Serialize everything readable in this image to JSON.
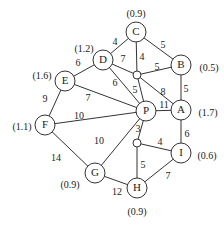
{
  "diagram": {
    "type": "weighted-graph",
    "nodes": [
      {
        "id": "C",
        "label": "C",
        "value": "(0.9)"
      },
      {
        "id": "B",
        "label": "B",
        "value": "(0.5)"
      },
      {
        "id": "D",
        "label": "D",
        "value": "(1.2)"
      },
      {
        "id": "E",
        "label": "E",
        "value": "(1.6)"
      },
      {
        "id": "P",
        "label": "P",
        "value": ""
      },
      {
        "id": "A",
        "label": "A",
        "value": "(1.7)"
      },
      {
        "id": "F",
        "label": "F",
        "value": "(1.1)"
      },
      {
        "id": "I",
        "label": "I",
        "value": "(0.6)"
      },
      {
        "id": "G",
        "label": "G",
        "value": "(0.9)"
      },
      {
        "id": "H",
        "label": "H",
        "value": "(0.9)"
      }
    ],
    "junctions": [
      "J1",
      "J2"
    ],
    "edges": [
      {
        "from": "D",
        "to": "C",
        "weight": "4"
      },
      {
        "from": "C",
        "to": "B",
        "weight": "5"
      },
      {
        "from": "C",
        "to": "J1",
        "weight": "4"
      },
      {
        "from": "D",
        "to": "J1",
        "weight": "7"
      },
      {
        "from": "J1",
        "to": "B",
        "weight": "5"
      },
      {
        "from": "E",
        "to": "D",
        "weight": "6"
      },
      {
        "from": "D",
        "to": "P",
        "weight": "6"
      },
      {
        "from": "J1",
        "to": "P",
        "weight": "5"
      },
      {
        "from": "J1",
        "to": "A",
        "weight": "8"
      },
      {
        "from": "B",
        "to": "A",
        "weight": "5"
      },
      {
        "from": "E",
        "to": "P",
        "weight": "7"
      },
      {
        "from": "E",
        "to": "F",
        "weight": "9"
      },
      {
        "from": "F",
        "to": "P",
        "weight": "10"
      },
      {
        "from": "P",
        "to": "A",
        "weight": "11"
      },
      {
        "from": "P",
        "to": "J2",
        "weight": "3"
      },
      {
        "from": "J2",
        "to": "I",
        "weight": "4"
      },
      {
        "from": "A",
        "to": "I",
        "weight": "6"
      },
      {
        "from": "F",
        "to": "G",
        "weight": "14"
      },
      {
        "from": "P",
        "to": "G",
        "weight": "10"
      },
      {
        "from": "J2",
        "to": "H",
        "weight": "5"
      },
      {
        "from": "G",
        "to": "H",
        "weight": "12"
      },
      {
        "from": "H",
        "to": "I",
        "weight": "7"
      }
    ]
  }
}
